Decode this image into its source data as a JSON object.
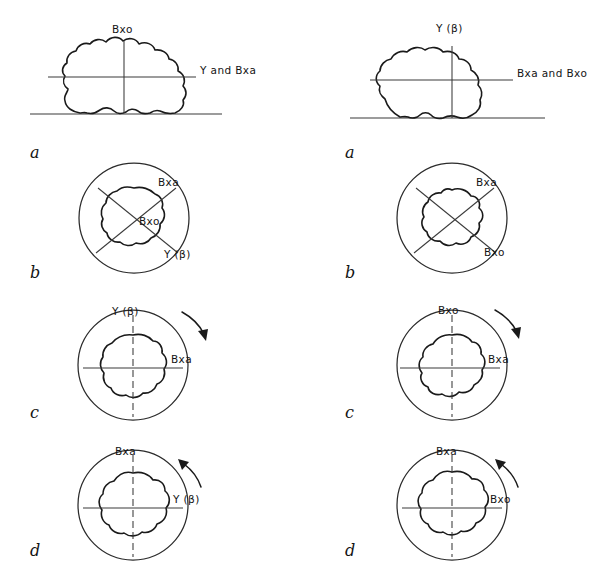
{
  "figure": {
    "columns": 2,
    "rows": 4,
    "ink_color": "#1a1a1a",
    "background_color": "#ffffff"
  },
  "panels": {
    "left_a": {
      "letter": "a",
      "kind": "resting-particle-side-view",
      "labels": {
        "vertical_axis": "Bxo",
        "horizontal_axis": "Y and Bxa"
      }
    },
    "right_a": {
      "letter": "a",
      "kind": "resting-particle-side-view",
      "labels": {
        "vertical_axis": "Y (β)",
        "horizontal_axis": "Bxa and Bxo"
      }
    },
    "left_b": {
      "letter": "b",
      "kind": "circle-with-blob-diagonals",
      "labels": {
        "diagonal_upper_right": "Bxa",
        "center": "Bxo",
        "diagonal_lower_right": "Y (β)"
      }
    },
    "right_b": {
      "letter": "b",
      "kind": "circle-with-blob-diagonals",
      "labels": {
        "diagonal_upper_right": "Bxa",
        "diagonal_lower_right": "Bxo"
      }
    },
    "left_c": {
      "letter": "c",
      "kind": "circle-with-blob-cross-arrow",
      "labels": {
        "vertical_axis": "Y (β)",
        "horizontal_axis": "Bxa"
      },
      "arrow": {
        "direction": "clockwise",
        "position": "upper-right"
      }
    },
    "right_c": {
      "letter": "c",
      "kind": "circle-with-blob-cross-arrow",
      "labels": {
        "vertical_axis": "Bxo",
        "horizontal_axis": "Bxa"
      },
      "arrow": {
        "direction": "clockwise",
        "position": "upper-right"
      }
    },
    "left_d": {
      "letter": "d",
      "kind": "circle-with-blob-cross-arrow",
      "labels": {
        "vertical_axis": "Bxa",
        "horizontal_axis": "Y (β)"
      },
      "arrow": {
        "direction": "counter-clockwise",
        "position": "upper-right"
      }
    },
    "right_d": {
      "letter": "d",
      "kind": "circle-with-blob-cross-arrow",
      "labels": {
        "vertical_axis": "Bxa",
        "horizontal_axis": "Bxo"
      },
      "arrow": {
        "direction": "counter-clockwise",
        "position": "upper-right"
      }
    }
  }
}
